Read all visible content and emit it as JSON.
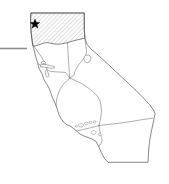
{
  "figure": {
    "kind": "locator-map",
    "background_color": "#ffffff",
    "width": 169,
    "height": 184
  },
  "map": {
    "outline_color": "#555555",
    "boundary_color": "#777777",
    "fill_color": "#ffffff",
    "state_outline_path": "M31.0,13.0 L84.3,13.0 L84.3,29.5 L84.9,38.2 L87.2,44.5 L91.0,49.0 L97.5,54.5 L104.0,60.5 L112.0,68.0 L120.0,75.5 L128.0,83.0 L136.0,90.5 L143.0,97.5 L149.5,104.5 L153.5,110.0 L155.0,113.5 L154.0,119.0 L152.5,126.0 L151.0,133.0 L149.8,140.0 L148.8,148.0 L148.3,156.0 L148.0,162.3 L122.0,162.3 L108.0,162.3 L104.5,158.5 L101.0,152.0 L98.5,146.0 L96.0,141.5 L92.0,139.0 L88.0,137.5 L84.0,136.0 L80.0,134.0 L76.5,131.0 L73.0,128.0 L70.0,126.0 L66.5,124.5 L63.5,122.0 L61.0,118.5 L59.0,114.5 L57.5,110.0 L56.0,105.5 L54.0,101.0 L52.0,96.5 L50.5,92.0 L49.0,88.0 L47.0,84.5 L45.0,81.5 L43.5,78.5 L42.5,75.0 L41.0,72.0 L39.5,69.5 L38.5,67.0 L38.0,64.0 L37.0,61.0 L36.0,57.5 L35.0,54.0 L34.0,50.0 L33.0,46.0 L32.3,42.0 L31.8,38.0 L31.2,33.0 L30.8,27.0 L30.6,21.0 Z",
    "highlight": {
      "label": "hatched-study-area",
      "hatch_color": "#b4b4b4",
      "hatch_angle_deg": 45,
      "hatch_spacing_px": 3,
      "path": "M31.0,13.0 L84.3,13.0 L84.3,29.5 L84.9,38.2 L83.0,38.6 L79.0,39.5 L75.0,40.5 L71.0,41.5 L67.0,42.8 L63.0,43.6 L59.0,44.2 L55.0,44.0 L51.0,43.2 L47.0,42.6 L43.5,43.2 L40.0,44.5 L36.5,45.5 L34.0,46.0 L33.0,46.0 L32.3,42.0 L31.8,38.0 L31.2,33.0 L30.8,27.0 L30.6,21.0 Z"
    },
    "internal_boundaries": [
      "M67.5,42.2 L67.8,48.0 L68.2,55.0 L68.6,62.0 L69.0,68.0 L69.4,73.5 L69.8,78.0",
      "M34.0,46.0 L36.5,50.0 L39.0,53.5 L41.5,57.0 L43.5,60.5 L45.0,63.0 L46.0,65.5 L46.5,68.0 L47.5,70.0 L49.5,71.0 L52.0,71.5 L55.0,71.8 L58.5,72.0 L62.0,72.2 L65.5,72.5 L69.8,78.0",
      "M69.8,78.0 L74.0,80.0 L78.5,82.0 L83.0,84.5 L87.5,87.5 L91.5,90.5 L95.0,93.5 L98.0,97.0 L100.0,101.0 L101.0,106.0 L101.5,111.0 L101.0,116.0 L100.0,121.0 L99.0,125.5",
      "M99.0,125.5 L103.0,125.0 L108.0,124.5 L113.0,124.0 L118.5,123.3 L124.0,122.5 L129.0,121.8 L134.0,121.0 L138.5,120.3 L143.0,119.5 L148.0,118.8 L152.5,118.2",
      "M99.0,125.5 L95.5,126.5 L91.5,127.5 L87.5,128.5 L83.0,129.5 L79.0,130.5 L76.5,131.0",
      "M99.0,125.5 L99.5,130.0 L100.5,134.0 L101.5,137.5 L102.0,140.5 L101.0,143.5 L99.5,145.5 L98.5,146.0",
      "M69.8,78.0 L67.0,80.5 L64.5,83.0 L62.0,86.0 L60.0,89.5 L58.5,93.0 L57.2,97.0 L56.5,101.0 L56.0,105.5",
      "M84.9,38.2 L85.5,43.0 L86.0,47.0 L86.5,51.0 L86.0,54.5 L84.5,57.5 L82.5,60.0 L80.5,62.5 L78.5,65.0 L76.5,68.0 L75.0,71.5 L74.0,75.0 L69.8,78.0"
    ],
    "bay_features": [
      "M40.5,65.0 L43.0,64.5 L45.5,64.5 L48.0,65.0 L50.5,65.5 L52.5,66.0 L54.0,66.5 L55.0,67.3 L54.0,68.0 L52.0,68.2 L49.5,68.0 L47.0,67.5 L44.5,67.2 L42.0,67.0 L40.0,66.5 Z",
      "M41.5,62.0 L43.5,61.5 L45.0,61.8 L45.5,62.8 L44.5,63.5 L42.5,63.8 L41.2,63.2 Z",
      "M46.5,69.5 L47.5,71.5 L48.5,74.0 L49.0,76.5 L48.0,77.5 L46.5,76.5 L45.5,74.0 L45.2,71.5 Z",
      "M38.0,64.0 L40.5,65.0"
    ],
    "lake_feature": {
      "label": "lake-tahoe",
      "path": "M85.5,55.5 C87.8,54.3 90.3,55.2 90.8,57.5 C91.3,60.0 89.8,62.3 87.5,62.5 C85.2,62.7 83.8,60.8 83.9,58.5 C84.0,56.8 84.6,56.0 85.5,55.5 Z"
    },
    "islands": [
      "M79.5,124.0 C81.0,123.2 83.0,123.6 83.4,124.8 C83.8,126.0 82.5,127.0 80.8,127.0 C79.2,127.0 78.3,125.8 78.6,124.8 Z",
      "M85.0,122.5 C86.2,121.8 87.8,122.2 88.0,123.2 C88.2,124.2 87.0,125.0 85.7,124.8 C84.6,124.6 84.2,123.3 84.6,122.7 Z",
      "M89.5,121.5 C90.6,121.0 91.8,121.4 91.9,122.3 C92.0,123.2 90.9,123.8 89.9,123.5 C89.1,123.2 88.9,122.0 89.3,121.6 Z",
      "M93.5,121.0 C94.6,120.5 95.9,120.9 96.0,121.8 C96.1,122.7 95.0,123.3 94.0,123.0 C93.2,122.7 93.0,121.5 93.5,121.0 Z",
      "M92.0,131.0 C93.6,130.2 95.6,130.6 96.0,131.9 C96.4,133.2 95.0,134.3 93.3,134.2 C91.7,134.1 90.8,132.8 91.2,131.9 Z",
      "M98.5,133.5 C99.6,133.0 100.8,133.4 100.9,134.3 C101.0,135.2 99.9,135.8 98.9,135.5 C98.1,135.2 97.9,134.0 98.4,133.6 Z",
      "M75.5,125.5 C76.4,125.1 77.4,125.5 77.4,126.2 C77.4,126.9 76.5,127.3 75.7,127.0 C75.1,126.8 75.1,125.8 75.5,125.5 Z"
    ]
  },
  "markers": {
    "star": {
      "label": "site-location-star",
      "color": "#000000",
      "x": 35,
      "y": 24,
      "radius": 5.2,
      "points": 5
    },
    "leader_line": {
      "label": "scale-or-leader-line",
      "color": "#8d8d8d",
      "x1": 0,
      "y1": 48.5,
      "x2": 27,
      "y2": 48.5
    }
  }
}
